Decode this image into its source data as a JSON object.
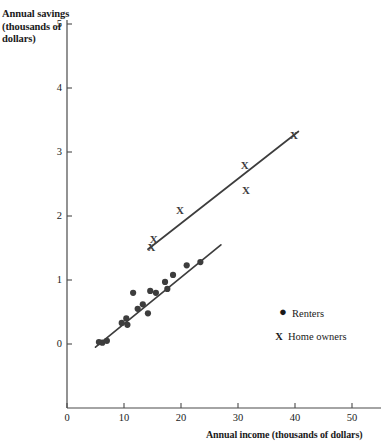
{
  "chart_data": {
    "type": "scatter",
    "title": "",
    "xlabel": "Annual income (thousands of dollars)",
    "ylabel": "Annual savings (thousands of dollars)",
    "xlim": [
      0,
      50
    ],
    "ylim": [
      0,
      5
    ],
    "xticks": [
      0,
      10,
      20,
      30,
      40,
      50
    ],
    "yticks": [
      0,
      1,
      2,
      3,
      4,
      5
    ],
    "xtick_labels": [
      "0",
      "10",
      "20",
      "30",
      "40",
      "50"
    ],
    "ytick_labels": [
      "0",
      "1",
      "2",
      "3",
      "4",
      "5"
    ],
    "grid": false,
    "legend_position": "inside-lower-right",
    "series": [
      {
        "name": "Renters",
        "marker": "dot",
        "marker_symbol": "●",
        "color": "#3d3d3d",
        "points": [
          {
            "x": 5.6,
            "y": 0.03
          },
          {
            "x": 6.2,
            "y": 0.02
          },
          {
            "x": 7.0,
            "y": 0.05
          },
          {
            "x": 9.6,
            "y": 0.33
          },
          {
            "x": 10.4,
            "y": 0.4
          },
          {
            "x": 10.6,
            "y": 0.3
          },
          {
            "x": 11.6,
            "y": 0.8
          },
          {
            "x": 12.4,
            "y": 0.55
          },
          {
            "x": 13.3,
            "y": 0.62
          },
          {
            "x": 14.2,
            "y": 0.48
          },
          {
            "x": 14.6,
            "y": 0.83
          },
          {
            "x": 15.6,
            "y": 0.8
          },
          {
            "x": 17.2,
            "y": 0.97
          },
          {
            "x": 17.6,
            "y": 0.86
          },
          {
            "x": 18.6,
            "y": 1.08
          },
          {
            "x": 21.0,
            "y": 1.23
          },
          {
            "x": 23.4,
            "y": 1.28
          }
        ],
        "fit_line": {
          "x1": 5.0,
          "y1": -0.05,
          "x2": 27.0,
          "y2": 1.55
        }
      },
      {
        "name": "Home owners",
        "marker": "x",
        "marker_symbol": "X",
        "color": "#3d3d3d",
        "points": [
          {
            "x": 14.8,
            "y": 1.52
          },
          {
            "x": 15.2,
            "y": 1.64
          },
          {
            "x": 19.8,
            "y": 2.1
          },
          {
            "x": 31.2,
            "y": 2.8
          },
          {
            "x": 31.4,
            "y": 2.4
          },
          {
            "x": 39.8,
            "y": 3.26
          }
        ],
        "fit_line": {
          "x1": 14.2,
          "y1": 1.48,
          "x2": 40.6,
          "y2": 3.32
        }
      }
    ]
  },
  "legend": {
    "items": [
      {
        "marker": "●",
        "label": "Renters"
      },
      {
        "marker": "X",
        "label": "Home owners"
      }
    ]
  },
  "colors": {
    "axis": "#4a4a4a",
    "marker": "#3d3d3d",
    "line": "#3d3d3d",
    "text": "#1a1a1a",
    "background": "#ffffff"
  }
}
